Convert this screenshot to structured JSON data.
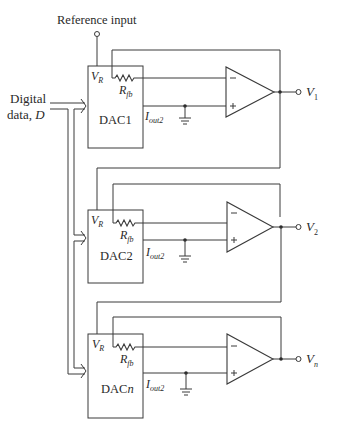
{
  "diagram": {
    "type": "circuit-schematic",
    "reference_input_label": "Reference input",
    "digital_input_label_line1": "Digital",
    "digital_input_label_line2": "data, ",
    "digital_input_symbol": "D",
    "stages": [
      {
        "dac_label": "DAC1",
        "vr_label": "V",
        "vr_sub": "R",
        "rfb_label": "R",
        "rfb_sub": "fb",
        "iout_label": "I",
        "iout_sub": "out2",
        "output_label": "V",
        "output_sub": "1"
      },
      {
        "dac_label": "DAC2",
        "vr_label": "V",
        "vr_sub": "R",
        "rfb_label": "R",
        "rfb_sub": "fb",
        "iout_label": "I",
        "iout_sub": "out2",
        "output_label": "V",
        "output_sub": "2"
      },
      {
        "dac_label_prefix": "DAC",
        "dac_label_suffix": "n",
        "vr_label": "V",
        "vr_sub": "R",
        "rfb_label": "R",
        "rfb_sub": "fb",
        "iout_label": "I",
        "iout_sub": "out2",
        "output_label": "V",
        "output_sub": "n"
      }
    ],
    "opamp_minus": "−",
    "opamp_plus": "+"
  }
}
